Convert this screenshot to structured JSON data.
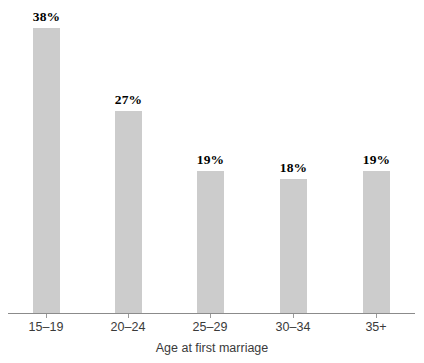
{
  "chart_data": {
    "type": "bar",
    "title": "",
    "subtitle": "",
    "xlabel": "Age at first marriage",
    "ylabel": "",
    "categories": [
      "15–19",
      "20–24",
      "25–29",
      "30–34",
      "35+"
    ],
    "values": [
      38,
      27,
      19,
      18,
      19
    ],
    "value_labels": [
      "38%",
      "27%",
      "19%",
      "18%",
      "19%"
    ],
    "ylim": [
      0,
      38
    ],
    "grid": false,
    "legend": null,
    "annotations": [],
    "series": [
      {
        "name": "",
        "values": [
          38,
          27,
          19,
          18,
          19
        ]
      }
    ]
  },
  "style": {
    "bar_color": "#cccccc",
    "axis_color": "#8b8b8b",
    "tick_color": "#9a9a9a",
    "label_color": "#3a3a3a",
    "value_color": "#000000",
    "background": "#ffffff"
  },
  "axis": {
    "title": "Age at first marriage"
  }
}
